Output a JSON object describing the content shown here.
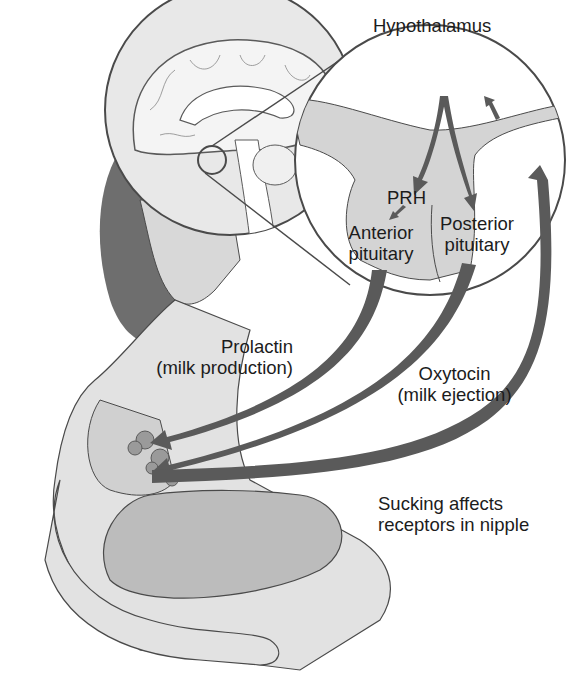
{
  "figure": {
    "labels": {
      "hypothalamus": "Hypothalamus",
      "prh": "PRH",
      "anterior_pituitary_line1": "Anterior",
      "anterior_pituitary_line2": "pituitary",
      "posterior_pituitary_line1": "Posterior",
      "posterior_pituitary_line2": "pituitary",
      "prolactin_line1": "Prolactin",
      "prolactin_line2": "(milk production)",
      "oxytocin_line1": "Oxytocin",
      "oxytocin_line2": "(milk ejection)",
      "sucking_line1": "Sucking affects",
      "sucking_line2": "receptors in nipple"
    },
    "colors": {
      "arrow": "#5a5a5a",
      "outline": "#4a4a4a",
      "tissue_fill": "#d4d4d4",
      "skin_fill": "#e2e2e2",
      "hair_fill": "#6e6e6e",
      "background": "#ffffff"
    }
  }
}
